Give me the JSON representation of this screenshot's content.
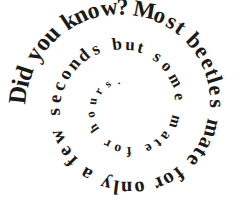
{
  "figure": {
    "title": "Did you know? Most beetles mate for only a few seconds but some mate for hours.",
    "kind": "spiral-typography",
    "background_color": "#ffffff",
    "ink_color": "#1a1a1a",
    "canvas": {
      "width": 245,
      "height": 218
    }
  },
  "spiral_text": {
    "full_text": "Did you know? Most beetles mate for only a few seconds but some mate for hours.",
    "words": [
      "Did",
      "you",
      "know?",
      "Most",
      "beetles",
      "mate",
      "for",
      "only",
      "a",
      "few",
      "seconds",
      "but",
      "some",
      "mate",
      "for",
      "hours."
    ],
    "direction": "clockwise-inward",
    "start_position": "outer-left",
    "turns": 2.2,
    "font_weight": "bold",
    "font_style": "serif",
    "start_font_size": 25,
    "end_font_size": 11,
    "center": {
      "x": 126,
      "y": 107
    },
    "start_radius": 101,
    "end_radius": 23,
    "start_angle_deg": 182,
    "total_sweep_deg": 800
  }
}
